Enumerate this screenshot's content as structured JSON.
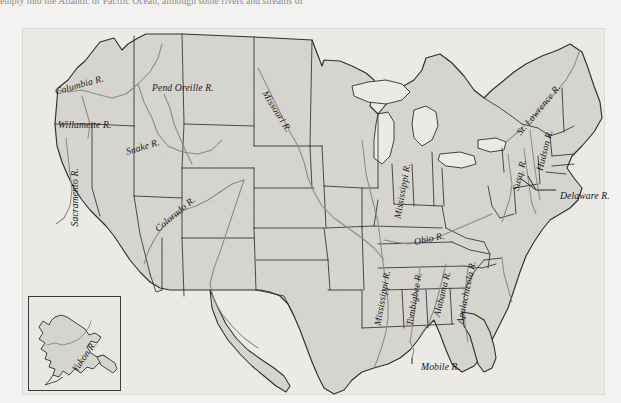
{
  "page": {
    "clipped_text_line": "empty into the Atlantic or Pacific Ocean, although some rivers and streams of",
    "background_color": "#f3f2f0"
  },
  "figure": {
    "name": "us-rivers-map",
    "panel_fill": "#eceae7",
    "land_fill": "#d6d4cf",
    "state_border_color": "#2f2e31",
    "river_color": "#8d8b86"
  },
  "labels": [
    {
      "text": "Columbia R.",
      "x": 33,
      "y": 58,
      "rot": -16,
      "size": 9.6
    },
    {
      "text": "Willamette R.",
      "x": 36,
      "y": 91,
      "rot": 0,
      "size": 9.6
    },
    {
      "text": "Pend Oreille R.",
      "x": 130,
      "y": 54,
      "rot": 0,
      "size": 9.6
    },
    {
      "text": "Snake R.",
      "x": 104,
      "y": 118,
      "rot": -17,
      "size": 9.6
    },
    {
      "text": "Sacramento R.",
      "x": 52,
      "y": 193,
      "rot": -90,
      "size": 9.6
    },
    {
      "text": "Missouri R.",
      "x": 243,
      "y": 58,
      "rot": 58,
      "size": 9.6
    },
    {
      "text": "Colorado R.",
      "x": 134,
      "y": 196,
      "rot": -40,
      "size": 9.6
    },
    {
      "text": "Mississippi R.",
      "x": 375,
      "y": 185,
      "rot": -80,
      "size": 9.6
    },
    {
      "text": "Ohio R.",
      "x": 392,
      "y": 208,
      "rot": -12,
      "size": 9.6
    },
    {
      "text": "Mississippi R.",
      "x": 355,
      "y": 292,
      "rot": -80,
      "size": 9.6
    },
    {
      "text": "Tombigbee R.",
      "x": 387,
      "y": 292,
      "rot": -80,
      "size": 9.6
    },
    {
      "text": "Alabama R.",
      "x": 414,
      "y": 283,
      "rot": -76,
      "size": 9.6
    },
    {
      "text": "Apalachicola R.",
      "x": 437,
      "y": 290,
      "rot": -78,
      "size": 9.6
    },
    {
      "text": "Mobile R.",
      "x": 399,
      "y": 333,
      "rot": 0,
      "size": 9.6
    },
    {
      "text": "St. Lawrence R.",
      "x": 496,
      "y": 100,
      "rot": -50,
      "size": 9.6
    },
    {
      "text": "Hudson R.",
      "x": 517,
      "y": 137,
      "rot": -76,
      "size": 9.6
    },
    {
      "text": "Susq. R.",
      "x": 493,
      "y": 157,
      "rot": -76,
      "size": 9.6
    },
    {
      "text": "Delaware R.",
      "x": 538,
      "y": 162,
      "rot": 0,
      "size": 9.6
    },
    {
      "text": "Yukon R.",
      "x": 52,
      "y": 337,
      "rot": -55,
      "size": 9.6
    }
  ],
  "inset": {
    "name": "alaska-inset",
    "label": "Yukon R."
  }
}
